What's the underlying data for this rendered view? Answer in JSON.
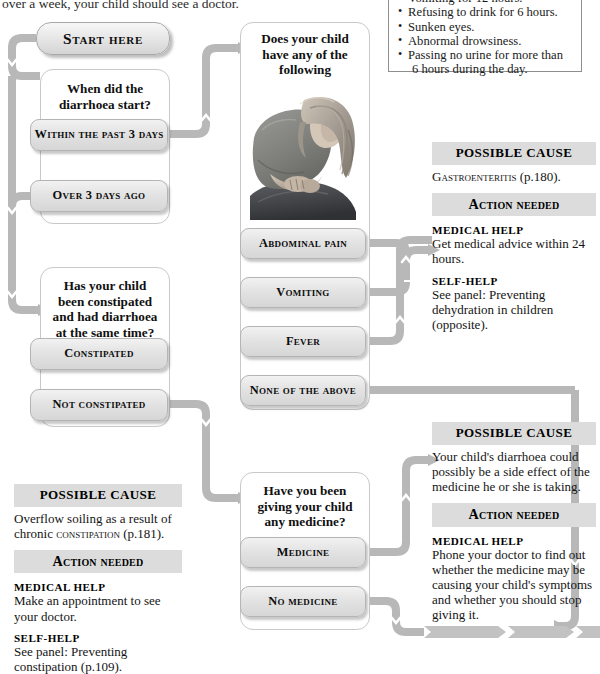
{
  "page": {
    "clipped_top_sentence": "over a week, your child should see a doctor."
  },
  "warning": {
    "items": [
      "Vomiting for 12 hours.",
      "Refusing to drink for 6 hours.",
      "Sunken eyes.",
      "Abnormal drowsiness.",
      "Passing no urine for more than",
      "6 hours during the day."
    ]
  },
  "start": {
    "label": "Start here"
  },
  "q1": {
    "title": "When did the diarrhoea start?",
    "options": [
      "Within the past 3 days",
      "Over 3 days ago"
    ]
  },
  "q2": {
    "title": "Has your child been constipated and had diarrhoea at the same time?",
    "options": [
      "Constipated",
      "Not constipated"
    ]
  },
  "q3": {
    "title": "Does your child have any of the following symptoms?",
    "photo_alt": "child-holding-stomach-photo",
    "options": [
      "Abdominal pain",
      "Vomiting",
      "Fever",
      "None of the above"
    ]
  },
  "q4": {
    "title": "Have you been giving your child any medicine?",
    "options": [
      "Medicine",
      "No medicine"
    ]
  },
  "outcome_gastro": {
    "cause_header": "POSSIBLE CAUSE",
    "cause_text_sc": "Gastroenteritis",
    "cause_text_rest": " (p.180).",
    "action_header": "Action needed",
    "medical_label": "MEDICAL HELP",
    "medical_text": "Get medical advice within 24 hours.",
    "self_label": "SELF-HELP",
    "self_prefix": "See panel: ",
    "self_italic": "Preventing dehydration in children",
    "self_suffix": " (opposite)."
  },
  "outcome_constipation": {
    "cause_header": "POSSIBLE CAUSE",
    "cause_prefix": "Overflow soiling as a result of chronic ",
    "cause_sc": "constipation",
    "cause_suffix": " (p.181).",
    "action_header": "Action needed",
    "medical_label": "MEDICAL HELP",
    "medical_text": "Make an appointment to see your doctor.",
    "self_label": "SELF-HELP",
    "self_prefix": "See panel: ",
    "self_italic": "Preventing constipation",
    "self_suffix": " (p.109)."
  },
  "outcome_medicine": {
    "cause_header": "POSSIBLE CAUSE",
    "cause_text": "Your child's diarrhoea could possibly be a side effect of the medicine he or she is taking.",
    "action_header": "Action needed",
    "medical_label": "MEDICAL HELP",
    "medical_text": "Phone your doctor to find out whether the medicine may be causing your child's symptoms and whether you should stop giving it."
  },
  "colors": {
    "wire": "#b8b8b8",
    "band": "#dcdcdc",
    "box_border": "#c9c9c9",
    "pill_border": "#b4b4b4"
  }
}
